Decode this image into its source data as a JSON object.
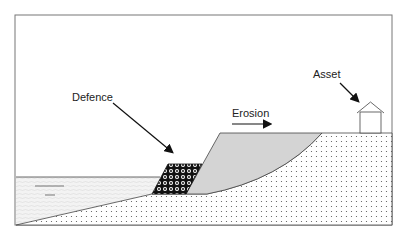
{
  "diagram": {
    "labels": {
      "defence": "Defence",
      "erosion": "Erosion",
      "asset": "Asset"
    },
    "regions": [
      "sea",
      "defence",
      "eroded-cliff",
      "ground"
    ],
    "colors": {
      "frame": "#666666",
      "eroded": "#d4d4d4",
      "water": "#f2f2f2",
      "ink": "#222222"
    }
  }
}
